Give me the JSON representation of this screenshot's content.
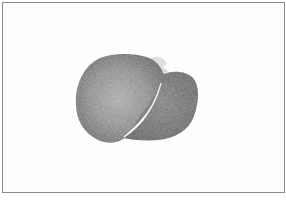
{
  "image": {
    "description": "Grayscale tissue specimen section with two lobes separated by a white fissure, inside a thin gray frame",
    "frame_color": "#8a8a8a",
    "background_color": "#ffffff",
    "specimen_colors": {
      "main_lobe_center": "#9a9a9a",
      "main_lobe_edge": "#5e5e5e",
      "side_lobe": "#6a6a6a",
      "fissure": "#ffffff"
    }
  }
}
